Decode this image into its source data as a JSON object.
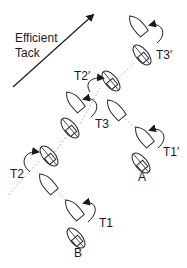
{
  "title": {
    "line1": "Efficient",
    "line2": "Tack"
  },
  "arrow": {
    "label": "efficient-tack-direction"
  },
  "labels": {
    "T1": "T1",
    "T2": "T2",
    "T3": "T3",
    "T1p": "T1′",
    "T2p": "T2′",
    "T3p": "T3′",
    "A": "A",
    "B": "B"
  },
  "colors": {
    "stroke": "#2b2b2b",
    "track": "#b8b8b8",
    "background": "#ffffff"
  }
}
